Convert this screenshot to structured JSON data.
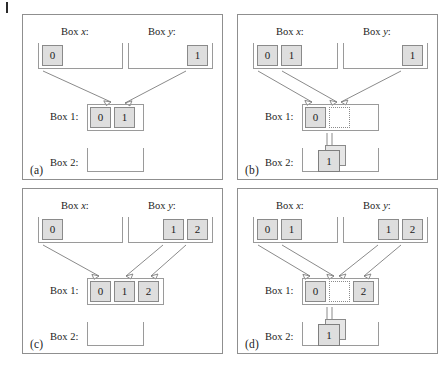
{
  "figure": {
    "caption_marks": {
      "margin_tick": "page-margin-tick"
    },
    "labels": {
      "box_x": "Box",
      "box_x_var": "x",
      "box_y": "Box",
      "box_y_var": "y",
      "colon": ":",
      "box1": "Box 1:",
      "box2": "Box 2:"
    },
    "panels": [
      {
        "id": "a",
        "tag": "(a)",
        "box_x_heading": "Box x:",
        "box_y_heading": "Box y:",
        "box1_label": "Box 1:",
        "box2_label": "Box 2:",
        "box_x_values": [
          "0"
        ],
        "box_y_values": [
          "1"
        ],
        "box1_values": [
          "0",
          "1"
        ],
        "box1_empty_index": -1,
        "box2_values": [],
        "box2_stack_value": "",
        "has_box2_arrow": false
      },
      {
        "id": "b",
        "tag": "(b)",
        "box_x_heading": "Box x:",
        "box_y_heading": "Box y:",
        "box1_label": "Box 1:",
        "box2_label": "Box 2:",
        "box_x_values": [
          "0",
          "1"
        ],
        "box_y_values": [
          "1"
        ],
        "box1_values": [
          "0",
          ""
        ],
        "box1_empty_index": 1,
        "box2_values": [
          "1"
        ],
        "box2_stack_value": "1",
        "has_box2_arrow": true
      },
      {
        "id": "c",
        "tag": "(c)",
        "box_x_heading": "Box x:",
        "box_y_heading": "Box y:",
        "box1_label": "Box 1:",
        "box2_label": "Box 2:",
        "box_x_values": [
          "0"
        ],
        "box_y_values": [
          "1",
          "2"
        ],
        "box1_values": [
          "0",
          "1",
          "2"
        ],
        "box1_empty_index": -1,
        "box2_values": [],
        "box2_stack_value": "",
        "has_box2_arrow": false
      },
      {
        "id": "d",
        "tag": "(d)",
        "box_x_heading": "Box x:",
        "box_y_heading": "Box y:",
        "box1_label": "Box 1:",
        "box2_label": "Box 2:",
        "box_x_values": [
          "0",
          "1"
        ],
        "box_y_values": [
          "1",
          "2"
        ],
        "box1_values": [
          "0",
          "",
          "2"
        ],
        "box1_empty_index": 1,
        "box2_values": [
          "1"
        ],
        "box2_stack_value": "1",
        "has_box2_arrow": true
      }
    ],
    "colors": {
      "cell_fill": "#dedede",
      "cell_border": "#8a8a8a",
      "container_border": "#9a9a9a",
      "panel_border": "#8f8f8f",
      "arrow": "#7d7d7d",
      "text": "#1c1c1c"
    }
  }
}
